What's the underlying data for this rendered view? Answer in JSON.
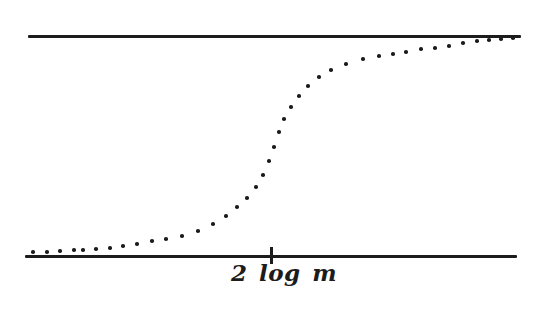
{
  "figure": {
    "background": "#ffffff",
    "ink_color": "#1c1c1c"
  },
  "chart_data": {
    "type": "scatter",
    "title": "",
    "xlabel": "",
    "ylabel": "",
    "x_tick_label": "2 log m",
    "grid": false,
    "legend": false,
    "upper_asymptote": {
      "y_px": 35,
      "x_start_px": 28,
      "x_end_px": 521,
      "thickness_px": 3
    },
    "lower_asymptote": {
      "y_px": 255,
      "x_start_px": 25,
      "x_end_px": 517,
      "thickness_px": 3
    },
    "tick": {
      "x_px": 271,
      "y_top_px": 247,
      "height_px": 17,
      "width_px": 3
    },
    "dot_radius_px": 1.8,
    "points_px": [
      [
        33,
        252
      ],
      [
        47,
        252
      ],
      [
        60,
        251
      ],
      [
        74,
        250
      ],
      [
        83,
        250
      ],
      [
        96,
        249
      ],
      [
        110,
        248
      ],
      [
        123,
        246
      ],
      [
        137,
        244
      ],
      [
        152,
        241
      ],
      [
        166,
        239
      ],
      [
        182,
        236
      ],
      [
        198,
        231
      ],
      [
        213,
        224
      ],
      [
        226,
        216
      ],
      [
        237,
        207
      ],
      [
        247,
        198
      ],
      [
        256,
        187
      ],
      [
        263,
        175
      ],
      [
        269,
        161
      ],
      [
        274,
        147
      ],
      [
        279,
        132
      ],
      [
        284,
        119
      ],
      [
        291,
        107
      ],
      [
        299,
        96
      ],
      [
        308,
        86
      ],
      [
        319,
        77
      ],
      [
        331,
        70
      ],
      [
        346,
        64
      ],
      [
        363,
        59
      ],
      [
        379,
        56
      ],
      [
        393,
        54
      ],
      [
        406,
        52
      ],
      [
        421,
        49
      ],
      [
        435,
        48
      ],
      [
        449,
        46
      ],
      [
        463,
        43
      ],
      [
        477,
        41
      ],
      [
        489,
        40
      ],
      [
        501,
        39
      ],
      [
        513,
        38
      ]
    ]
  }
}
